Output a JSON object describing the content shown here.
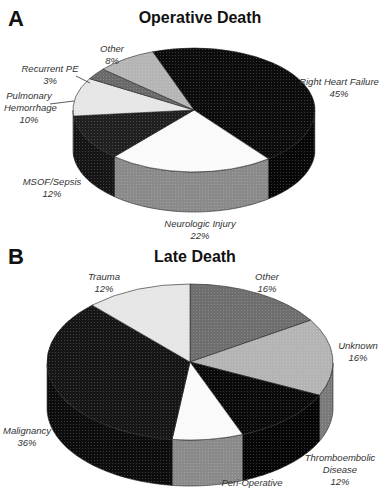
{
  "chart_data": [
    {
      "panel": "A",
      "type": "pie",
      "title": "Operative Death",
      "style": "3d",
      "slices": [
        {
          "label": "Right Heart Failure",
          "value": 45,
          "color": "#0c0c0c",
          "side": "#070707"
        },
        {
          "label": "Neurologic Injury",
          "value": 22,
          "color": "#fafafa",
          "side": "#8a8a8a"
        },
        {
          "label": "MSOF/Sepsis",
          "value": 12,
          "color": "#202020",
          "side": "#151515"
        },
        {
          "label": "Pulmonary Hemorrhage",
          "value": 10,
          "color": "#e6e6e6",
          "side": "#9a9a9a"
        },
        {
          "label": "Recurrent PE",
          "value": 3,
          "color": "#6a6a6a",
          "side": "#555555"
        },
        {
          "label": "Other",
          "value": 8,
          "color": "#b5b5b5",
          "side": "#8d8d8d"
        }
      ]
    },
    {
      "panel": "B",
      "type": "pie",
      "title": "Late Death",
      "style": "3d",
      "slices": [
        {
          "label": "Other",
          "value": 16,
          "color": "#6e6e6e",
          "side": "#555555"
        },
        {
          "label": "Unknown",
          "value": 16,
          "color": "#b4b4b4",
          "side": "#7a7a7a"
        },
        {
          "label": "Thromboembolic Disease",
          "value": 12,
          "color": "#0a0a0a",
          "side": "#060606"
        },
        {
          "label": "Peri-Operative",
          "value": null,
          "color": "#fafafa",
          "side": "#8a8a8a"
        },
        {
          "label": "Malignancy",
          "value": 36,
          "color": "#161616",
          "side": "#0d0d0d"
        },
        {
          "label": "Trauma",
          "value": 12,
          "color": "#e6e6e6",
          "side": "#a0a0a0"
        }
      ]
    }
  ],
  "panels": {
    "a": {
      "letter": "A",
      "title": "Operative Death",
      "labels": {
        "other": {
          "name": "Other",
          "pct": "8%"
        },
        "recurrent_pe": {
          "name": "Recurrent PE",
          "pct": "3%"
        },
        "pulmonary": {
          "name1": "Pulmonary",
          "name2": "Hemorrhage",
          "pct": "10%"
        },
        "msof": {
          "name": "MSOF/Sepsis",
          "pct": "12%"
        },
        "neuro": {
          "name": "Neurologic Injury",
          "pct": "22%"
        },
        "rhf": {
          "name": "Right Heart Failure",
          "pct": "45%"
        }
      }
    },
    "b": {
      "letter": "B",
      "title": "Late Death",
      "labels": {
        "trauma": {
          "name": "Trauma",
          "pct": "12%"
        },
        "other": {
          "name": "Other",
          "pct": "16%"
        },
        "unknown": {
          "name": "Unknown",
          "pct": "16%"
        },
        "malignancy": {
          "name": "Malignancy",
          "pct": "36%"
        },
        "thrombo": {
          "name1": "Thromboembolic",
          "name2": "Disease",
          "pct": "12%"
        },
        "periop": {
          "name": "Peri-Operative"
        }
      }
    }
  }
}
